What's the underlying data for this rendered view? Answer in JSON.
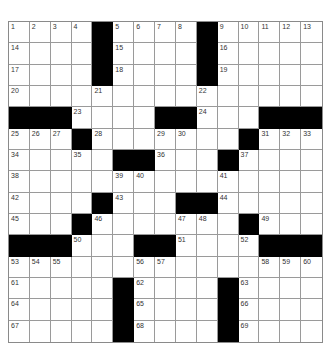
{
  "puzzle": {
    "rows": 15,
    "cols": 15,
    "colors": {
      "black": "#000000",
      "white": "#ffffff",
      "gridline": "#9a9a9a",
      "number": "#333333"
    },
    "layout": [
      "....#....#.....",
      "....#....#.....",
      "....#....#.....",
      "...............",
      "###....##...###",
      "...#.......#...",
      ".....##...#....",
      "...............",
      "....#...##.....",
      "...#.......#...",
      "###...##....###",
      "...............",
      ".....#....#....",
      ".....#....#....",
      ".....#....#...."
    ],
    "numbers": [
      {
        "r": 0,
        "c": 0,
        "n": "1"
      },
      {
        "r": 0,
        "c": 1,
        "n": "2"
      },
      {
        "r": 0,
        "c": 2,
        "n": "3"
      },
      {
        "r": 0,
        "c": 3,
        "n": "4"
      },
      {
        "r": 0,
        "c": 5,
        "n": "5"
      },
      {
        "r": 0,
        "c": 6,
        "n": "6"
      },
      {
        "r": 0,
        "c": 7,
        "n": "7"
      },
      {
        "r": 0,
        "c": 8,
        "n": "8"
      },
      {
        "r": 0,
        "c": 10,
        "n": "9"
      },
      {
        "r": 0,
        "c": 11,
        "n": "10"
      },
      {
        "r": 0,
        "c": 12,
        "n": "11"
      },
      {
        "r": 0,
        "c": 13,
        "n": "12"
      },
      {
        "r": 0,
        "c": 14,
        "n": "13"
      },
      {
        "r": 1,
        "c": 0,
        "n": "14"
      },
      {
        "r": 1,
        "c": 5,
        "n": "15"
      },
      {
        "r": 1,
        "c": 10,
        "n": "16"
      },
      {
        "r": 2,
        "c": 0,
        "n": "17"
      },
      {
        "r": 2,
        "c": 5,
        "n": "18"
      },
      {
        "r": 2,
        "c": 10,
        "n": "19"
      },
      {
        "r": 3,
        "c": 0,
        "n": "20"
      },
      {
        "r": 3,
        "c": 4,
        "n": "21"
      },
      {
        "r": 3,
        "c": 9,
        "n": "22"
      },
      {
        "r": 4,
        "c": 3,
        "n": "23"
      },
      {
        "r": 4,
        "c": 9,
        "n": "24"
      },
      {
        "r": 5,
        "c": 0,
        "n": "25"
      },
      {
        "r": 5,
        "c": 1,
        "n": "26"
      },
      {
        "r": 5,
        "c": 2,
        "n": "27"
      },
      {
        "r": 5,
        "c": 4,
        "n": "28"
      },
      {
        "r": 5,
        "c": 7,
        "n": "29"
      },
      {
        "r": 5,
        "c": 8,
        "n": "30"
      },
      {
        "r": 5,
        "c": 12,
        "n": "31"
      },
      {
        "r": 5,
        "c": 13,
        "n": "32"
      },
      {
        "r": 5,
        "c": 14,
        "n": "33"
      },
      {
        "r": 6,
        "c": 0,
        "n": "34"
      },
      {
        "r": 6,
        "c": 3,
        "n": "35"
      },
      {
        "r": 6,
        "c": 7,
        "n": "36"
      },
      {
        "r": 6,
        "c": 11,
        "n": "37"
      },
      {
        "r": 7,
        "c": 0,
        "n": "38"
      },
      {
        "r": 7,
        "c": 5,
        "n": "39"
      },
      {
        "r": 7,
        "c": 6,
        "n": "40"
      },
      {
        "r": 7,
        "c": 10,
        "n": "41"
      },
      {
        "r": 8,
        "c": 0,
        "n": "42"
      },
      {
        "r": 8,
        "c": 5,
        "n": "43"
      },
      {
        "r": 8,
        "c": 10,
        "n": "44"
      },
      {
        "r": 9,
        "c": 0,
        "n": "45"
      },
      {
        "r": 9,
        "c": 4,
        "n": "46"
      },
      {
        "r": 9,
        "c": 8,
        "n": "47"
      },
      {
        "r": 9,
        "c": 9,
        "n": "48"
      },
      {
        "r": 9,
        "c": 12,
        "n": "49"
      },
      {
        "r": 10,
        "c": 3,
        "n": "50"
      },
      {
        "r": 10,
        "c": 8,
        "n": "51"
      },
      {
        "r": 10,
        "c": 11,
        "n": "52"
      },
      {
        "r": 11,
        "c": 0,
        "n": "53"
      },
      {
        "r": 11,
        "c": 1,
        "n": "54"
      },
      {
        "r": 11,
        "c": 2,
        "n": "55"
      },
      {
        "r": 11,
        "c": 6,
        "n": "56"
      },
      {
        "r": 11,
        "c": 7,
        "n": "57"
      },
      {
        "r": 11,
        "c": 12,
        "n": "58"
      },
      {
        "r": 11,
        "c": 13,
        "n": "59"
      },
      {
        "r": 11,
        "c": 14,
        "n": "60"
      },
      {
        "r": 12,
        "c": 0,
        "n": "61"
      },
      {
        "r": 12,
        "c": 6,
        "n": "62"
      },
      {
        "r": 12,
        "c": 11,
        "n": "63"
      },
      {
        "r": 13,
        "c": 0,
        "n": "64"
      },
      {
        "r": 13,
        "c": 6,
        "n": "65"
      },
      {
        "r": 13,
        "c": 11,
        "n": "66"
      },
      {
        "r": 14,
        "c": 0,
        "n": "67"
      },
      {
        "r": 14,
        "c": 6,
        "n": "68"
      },
      {
        "r": 14,
        "c": 11,
        "n": "69"
      }
    ]
  }
}
